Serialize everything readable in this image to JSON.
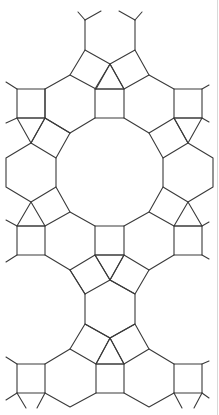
{
  "diagram": {
    "type": "tiling",
    "stroke_color": "#3a3a3a",
    "background": "#ffffff",
    "border_color": "#d9d9d9",
    "shapes": {
      "squares": [
        [
          [
            85,
            50
          ],
          [
            110,
            64
          ],
          [
            96,
            89
          ],
          [
            70,
            75
          ]
        ],
        [
          [
            135,
            50
          ],
          [
            110,
            64
          ],
          [
            124,
            89
          ],
          [
            149,
            75
          ]
        ],
        [
          [
            95,
            89
          ],
          [
            124,
            89
          ],
          [
            124,
            118
          ],
          [
            95,
            118
          ]
        ],
        [
          [
            17,
            89
          ],
          [
            45,
            89
          ],
          [
            45,
            118
          ],
          [
            17,
            118
          ]
        ],
        [
          [
            174,
            89
          ],
          [
            202,
            89
          ],
          [
            202,
            118
          ],
          [
            174,
            118
          ]
        ],
        [
          [
            45,
            118
          ],
          [
            70,
            133
          ],
          [
            56,
            158
          ],
          [
            31,
            143
          ]
        ],
        [
          [
            174,
            118
          ],
          [
            149,
            133
          ],
          [
            163,
            158
          ],
          [
            188,
            143
          ]
        ],
        [
          [
            17,
            226
          ],
          [
            45,
            226
          ],
          [
            45,
            255
          ],
          [
            17,
            255
          ]
        ],
        [
          [
            174,
            226
          ],
          [
            202,
            226
          ],
          [
            202,
            255
          ],
          [
            174,
            255
          ]
        ],
        [
          [
            95,
            226
          ],
          [
            124,
            226
          ],
          [
            124,
            255
          ],
          [
            95,
            255
          ]
        ],
        [
          [
            95,
            255
          ],
          [
            110,
            280
          ],
          [
            85,
            294
          ],
          [
            70,
            270
          ]
        ],
        [
          [
            124,
            255
          ],
          [
            110,
            280
          ],
          [
            135,
            294
          ],
          [
            149,
            270
          ]
        ],
        [
          [
            85,
            324
          ],
          [
            110,
            338
          ],
          [
            96,
            364
          ],
          [
            70,
            349
          ]
        ],
        [
          [
            135,
            324
          ],
          [
            110,
            338
          ],
          [
            124,
            364
          ],
          [
            149,
            349
          ]
        ],
        [
          [
            96,
            364
          ],
          [
            124,
            364
          ],
          [
            124,
            393
          ],
          [
            96,
            393
          ]
        ],
        [
          [
            17,
            364
          ],
          [
            45,
            364
          ],
          [
            45,
            393
          ],
          [
            17,
            393
          ]
        ],
        [
          [
            174,
            364
          ],
          [
            202,
            364
          ],
          [
            202,
            393
          ],
          [
            174,
            393
          ]
        ]
      ],
      "triangles": [
        [
          [
            110,
            64
          ],
          [
            95,
            89
          ],
          [
            124,
            89
          ]
        ],
        [
          [
            17,
            118
          ],
          [
            45,
            118
          ],
          [
            31,
            143
          ]
        ],
        [
          [
            174,
            118
          ],
          [
            202,
            118
          ],
          [
            188,
            143
          ]
        ],
        [
          [
            31,
            202
          ],
          [
            17,
            226
          ],
          [
            45,
            226
          ]
        ],
        [
          [
            188,
            202
          ],
          [
            174,
            226
          ],
          [
            202,
            226
          ]
        ],
        [
          [
            95,
            255
          ],
          [
            124,
            255
          ],
          [
            110,
            280
          ]
        ],
        [
          [
            110,
            338
          ],
          [
            96,
            364
          ],
          [
            124,
            364
          ]
        ]
      ],
      "polylines": [
        [
          [
            85,
            50
          ],
          [
            85,
            20
          ]
        ],
        [
          [
            85,
            20
          ],
          [
            78,
            12
          ]
        ],
        [
          [
            85,
            20
          ],
          [
            101,
            11
          ]
        ],
        [
          [
            135,
            50
          ],
          [
            135,
            20
          ]
        ],
        [
          [
            135,
            20
          ],
          [
            119,
            11
          ]
        ],
        [
          [
            135,
            20
          ],
          [
            142,
            12
          ]
        ],
        [
          [
            70,
            75
          ],
          [
            45,
            89
          ]
        ],
        [
          [
            149,
            75
          ],
          [
            174,
            89
          ]
        ],
        [
          [
            45,
            118
          ],
          [
            70,
            133
          ]
        ],
        [
          [
            17,
            89
          ],
          [
            6,
            82
          ]
        ],
        [
          [
            202,
            89
          ],
          [
            209,
            85
          ]
        ],
        [
          [
            17,
            118
          ],
          [
            6,
            123
          ]
        ],
        [
          [
            202,
            118
          ],
          [
            209,
            122
          ]
        ],
        [
          [
            70,
            133
          ],
          [
            95,
            118
          ]
        ],
        [
          [
            149,
            133
          ],
          [
            124,
            118
          ]
        ],
        [
          [
            56,
            158
          ],
          [
            56,
            187
          ],
          [
            31,
            202
          ],
          [
            6,
            187
          ],
          [
            6,
            158
          ],
          [
            31,
            143
          ]
        ],
        [
          [
            163,
            158
          ],
          [
            163,
            187
          ],
          [
            188,
            202
          ],
          [
            213,
            187
          ],
          [
            213,
            158
          ],
          [
            188,
            143
          ]
        ],
        [
          [
            56,
            187
          ],
          [
            70,
            212
          ],
          [
            95,
            226
          ]
        ],
        [
          [
            163,
            187
          ],
          [
            149,
            212
          ],
          [
            124,
            226
          ]
        ],
        [
          [
            70,
            212
          ],
          [
            45,
            226
          ]
        ],
        [
          [
            149,
            212
          ],
          [
            174,
            226
          ]
        ],
        [
          [
            17,
            226
          ],
          [
            6,
            220
          ]
        ],
        [
          [
            202,
            226
          ],
          [
            209,
            222
          ]
        ],
        [
          [
            17,
            255
          ],
          [
            6,
            262
          ]
        ],
        [
          [
            202,
            255
          ],
          [
            209,
            259
          ]
        ],
        [
          [
            45,
            255
          ],
          [
            70,
            270
          ]
        ],
        [
          [
            174,
            255
          ],
          [
            149,
            270
          ]
        ],
        [
          [
            85,
            294
          ],
          [
            85,
            324
          ],
          [
            110,
            338
          ],
          [
            135,
            324
          ],
          [
            135,
            294
          ],
          [
            110,
            280
          ]
        ],
        [
          [
            85,
            294
          ],
          [
            70,
            270
          ]
        ],
        [
          [
            70,
            349
          ],
          [
            45,
            364
          ]
        ],
        [
          [
            149,
            349
          ],
          [
            174,
            364
          ]
        ],
        [
          [
            17,
            364
          ],
          [
            6,
            357
          ]
        ],
        [
          [
            202,
            364
          ],
          [
            209,
            361
          ]
        ],
        [
          [
            17,
            393
          ],
          [
            6,
            400
          ]
        ],
        [
          [
            17,
            393
          ],
          [
            26,
            408
          ]
        ],
        [
          [
            45,
            393
          ],
          [
            37,
            408
          ]
        ],
        [
          [
            202,
            393
          ],
          [
            209,
            398
          ]
        ],
        [
          [
            202,
            393
          ],
          [
            194,
            408
          ]
        ],
        [
          [
            174,
            393
          ],
          [
            182,
            408
          ]
        ],
        [
          [
            45,
            393
          ],
          [
            70,
            407
          ],
          [
            96,
            393
          ]
        ],
        [
          [
            124,
            393
          ],
          [
            149,
            407
          ],
          [
            174,
            393
          ]
        ],
        [
          [
            45,
            118
          ],
          [
            45,
            89
          ]
        ]
      ]
    }
  }
}
